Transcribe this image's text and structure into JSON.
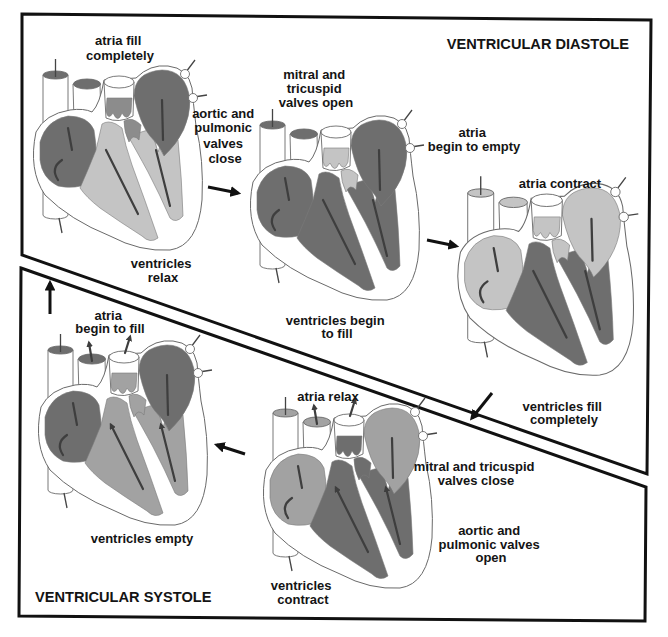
{
  "phases": {
    "diastole": {
      "title": "VENTRICULAR DIASTOLE"
    },
    "systole": {
      "title": "VENTRICULAR SYSTOLE"
    }
  },
  "shades": {
    "dark": "#6e6e6e",
    "mid": "#8c8c8c",
    "medium": "#a2a2a2",
    "light": "#c4c4c4"
  },
  "hearts": [
    {
      "stage": "atria-fill-completely",
      "phase": "diastole",
      "atria": "dark",
      "ventricles": "light",
      "valves": "mid",
      "flow": "down"
    },
    {
      "stage": "mitral-tricuspid-valves-open",
      "phase": "diastole",
      "atria": "dark",
      "ventricles": "dark",
      "valves": "light",
      "flow": "down"
    },
    {
      "stage": "atria-contract",
      "phase": "diastole",
      "atria": "light",
      "ventricles": "dark",
      "valves": "light",
      "flow": "down"
    },
    {
      "stage": "atria-relax",
      "phase": "systole",
      "atria": "medium",
      "ventricles": "dark",
      "valves": "dark",
      "flow": "up"
    },
    {
      "stage": "ventricles-empty",
      "phase": "systole",
      "atria": "dark",
      "ventricles": "medium",
      "valves": "medium",
      "flow": "up"
    }
  ],
  "sequence": [
    {
      "from": "atria-fill-completely",
      "to": "mitral-tricuspid-valves-open",
      "icon": "arrow-right"
    },
    {
      "from": "mitral-tricuspid-valves-open",
      "to": "atria-contract",
      "icon": "arrow-right"
    },
    {
      "from": "atria-contract",
      "to": "atria-relax",
      "icon": "arrow-down-left"
    },
    {
      "from": "atria-relax",
      "to": "ventricles-empty",
      "icon": "arrow-left"
    },
    {
      "from": "ventricles-empty",
      "to": "atria-fill-completely",
      "icon": "arrow-up"
    }
  ],
  "labels": [
    {
      "id": "atria-fill-completely",
      "lines": [
        "atria fill",
        "completely"
      ]
    },
    {
      "id": "aortic-pulmonic-valves-close",
      "lines": [
        "aortic and",
        "pulmonic",
        "valves",
        "close"
      ]
    },
    {
      "id": "mitral-tricuspid-valves-open",
      "lines": [
        "mitral and",
        "tricuspid",
        "valves open"
      ]
    },
    {
      "id": "atria-begin-to-empty",
      "lines": [
        "atria",
        "begin to empty"
      ]
    },
    {
      "id": "atria-contract",
      "lines": [
        "atria contract"
      ]
    },
    {
      "id": "ventricles-relax",
      "lines": [
        "ventricles",
        "relax"
      ]
    },
    {
      "id": "ventricles-begin-to-fill",
      "lines": [
        "ventricles begin",
        "to fill"
      ]
    },
    {
      "id": "ventricles-fill-completely",
      "lines": [
        "ventricles fill",
        "completely"
      ]
    },
    {
      "id": "atria-begin-to-fill",
      "lines": [
        "atria",
        "begin to fill"
      ]
    },
    {
      "id": "atria-relax",
      "lines": [
        "atria relax"
      ]
    },
    {
      "id": "mitral-tricuspid-valves-close",
      "lines": [
        "mitral and tricuspid",
        "valves close"
      ]
    },
    {
      "id": "aortic-pulmonic-valves-open",
      "lines": [
        "aortic and",
        "pulmonic valves",
        "open"
      ]
    },
    {
      "id": "ventricles-empty",
      "lines": [
        "ventricles empty"
      ]
    },
    {
      "id": "ventricles-contract",
      "lines": [
        "ventricles",
        "contract"
      ]
    }
  ]
}
